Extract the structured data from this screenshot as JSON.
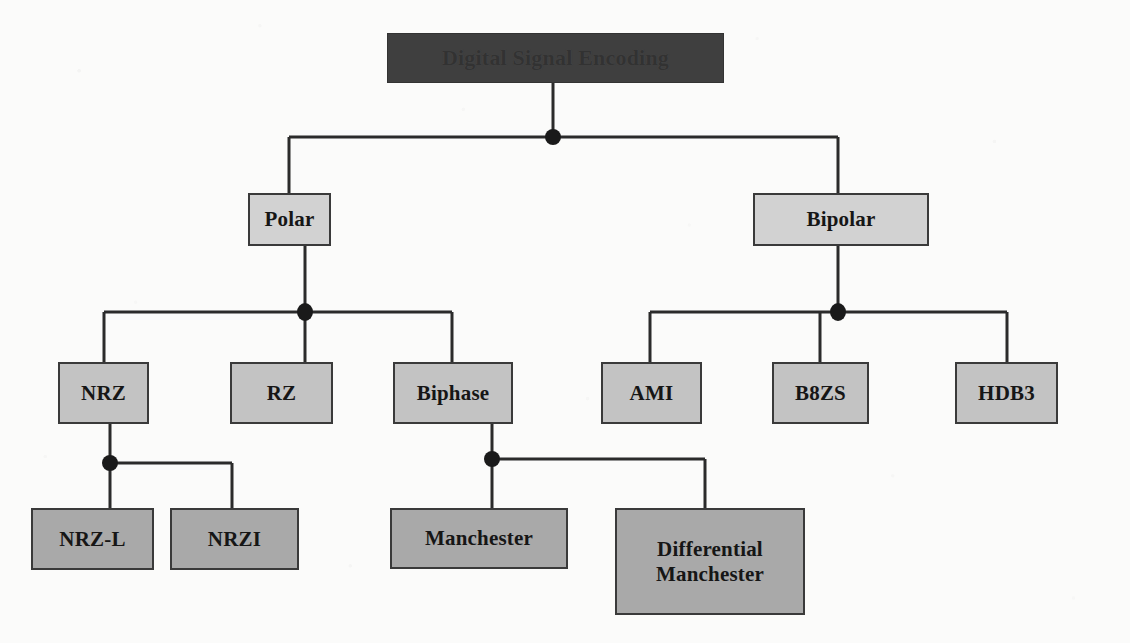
{
  "diagram": {
    "title": "Digital Signal Encoding",
    "type": "tree-hierarchy",
    "background_color": "#fbfbfa",
    "line_color": "#2b2b2b",
    "nodes": [
      {
        "id": "root",
        "label": "Digital Signal Encoding",
        "level": 1,
        "fill": "#3f3f3f",
        "text_color": "#323232",
        "x": 387,
        "y": 33,
        "w": 337,
        "h": 50
      },
      {
        "id": "polar",
        "label": "Polar",
        "level": 2,
        "fill": "#d2d2d2",
        "x": 248,
        "y": 193,
        "w": 83,
        "h": 53
      },
      {
        "id": "bipolar",
        "label": "Bipolar",
        "level": 2,
        "fill": "#d2d2d2",
        "x": 753,
        "y": 193,
        "w": 176,
        "h": 53
      },
      {
        "id": "nrz",
        "label": "NRZ",
        "level": 3,
        "fill": "#c3c3c3",
        "x": 58,
        "y": 362,
        "w": 91,
        "h": 62
      },
      {
        "id": "rz",
        "label": "RZ",
        "level": 3,
        "fill": "#c3c3c3",
        "x": 230,
        "y": 362,
        "w": 103,
        "h": 62
      },
      {
        "id": "biphase",
        "label": "Biphase",
        "level": 3,
        "fill": "#c3c3c3",
        "x": 393,
        "y": 362,
        "w": 120,
        "h": 62
      },
      {
        "id": "ami",
        "label": "AMI",
        "level": 3,
        "fill": "#c3c3c3",
        "x": 601,
        "y": 362,
        "w": 101,
        "h": 62
      },
      {
        "id": "b8zs",
        "label": "B8ZS",
        "level": 3,
        "fill": "#c3c3c3",
        "x": 772,
        "y": 362,
        "w": 97,
        "h": 62
      },
      {
        "id": "hdb3",
        "label": "HDB3",
        "level": 3,
        "fill": "#c3c3c3",
        "x": 955,
        "y": 362,
        "w": 103,
        "h": 62
      },
      {
        "id": "nrz-l",
        "label": "NRZ-L",
        "level": 4,
        "fill": "#a9a9a9",
        "x": 31,
        "y": 508,
        "w": 123,
        "h": 62
      },
      {
        "id": "nrzi",
        "label": "NRZI",
        "level": 4,
        "fill": "#a9a9a9",
        "x": 170,
        "y": 508,
        "w": 129,
        "h": 62
      },
      {
        "id": "manchester",
        "label": "Manchester",
        "level": 4,
        "fill": "#a9a9a9",
        "x": 390,
        "y": 508,
        "w": 178,
        "h": 61
      },
      {
        "id": "diff-manchester",
        "label": "Differential",
        "label_line2": "Manchester",
        "level": 4,
        "fill": "#a9a9a9",
        "x": 615,
        "y": 508,
        "w": 190,
        "h": 107
      }
    ],
    "junctions": [
      {
        "id": "root-junction",
        "x": 553,
        "y": 137
      },
      {
        "id": "polar-junction",
        "x": 305,
        "y": 312
      },
      {
        "id": "bipolar-junction",
        "x": 838,
        "y": 312
      },
      {
        "id": "nrz-junction",
        "x": 110,
        "y": 463
      },
      {
        "id": "biphase-junction",
        "x": 492,
        "y": 459
      }
    ],
    "edges": [
      {
        "from": "root",
        "to": "polar"
      },
      {
        "from": "root",
        "to": "bipolar"
      },
      {
        "from": "polar",
        "to": "nrz"
      },
      {
        "from": "polar",
        "to": "rz"
      },
      {
        "from": "polar",
        "to": "biphase"
      },
      {
        "from": "bipolar",
        "to": "ami"
      },
      {
        "from": "bipolar",
        "to": "b8zs"
      },
      {
        "from": "bipolar",
        "to": "hdb3"
      },
      {
        "from": "nrz",
        "to": "nrz-l"
      },
      {
        "from": "nrz",
        "to": "nrzi"
      },
      {
        "from": "biphase",
        "to": "manchester"
      },
      {
        "from": "biphase",
        "to": "diff-manchester"
      }
    ]
  }
}
